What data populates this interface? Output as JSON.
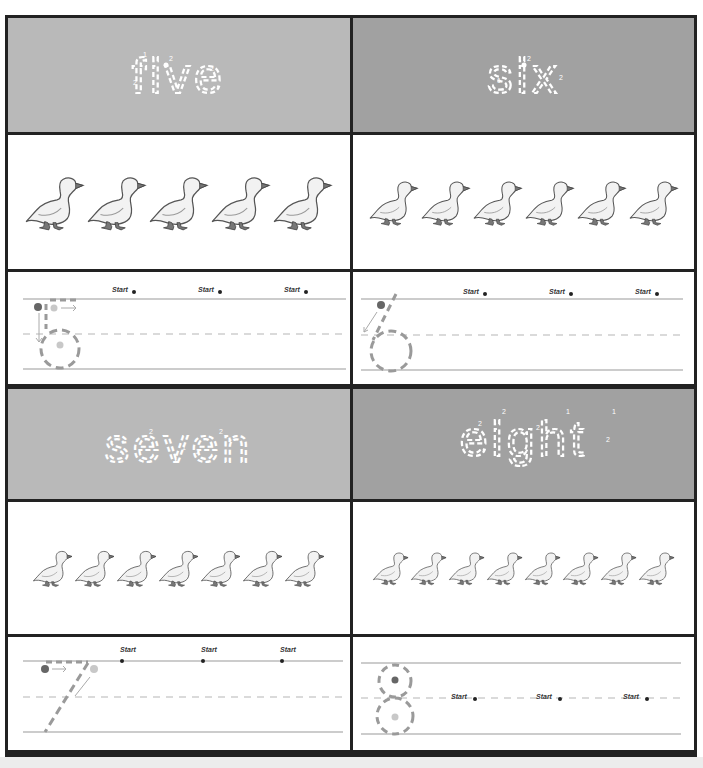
{
  "worksheet": {
    "cells": [
      {
        "id": "five",
        "word": "five",
        "number": 5,
        "duck_count": 5,
        "header_shade": "light",
        "trace_digit": "5",
        "start_labels": [
          "Start",
          "Start",
          "Start"
        ],
        "stroke_numbers": [
          "1",
          "2",
          "3"
        ]
      },
      {
        "id": "six",
        "word": "six",
        "number": 6,
        "duck_count": 6,
        "header_shade": "dark",
        "trace_digit": "6",
        "start_labels": [
          "Start",
          "Start",
          "Start"
        ],
        "stroke_numbers": [
          "1"
        ]
      },
      {
        "id": "seven",
        "word": "seven",
        "number": 7,
        "duck_count": 7,
        "header_shade": "light",
        "trace_digit": "7",
        "start_labels": [
          "Start",
          "Start",
          "Start"
        ],
        "stroke_numbers": [
          "1",
          "2"
        ]
      },
      {
        "id": "eight",
        "word": "eight",
        "number": 8,
        "duck_count": 8,
        "header_shade": "dark",
        "trace_digit": "8",
        "start_labels": [
          "Start",
          "Start",
          "Start"
        ],
        "stroke_numbers": [
          "1",
          "2"
        ]
      }
    ],
    "colors": {
      "frame": "#222222",
      "header_light": "#b9b9b9",
      "header_dark": "#a1a1a1",
      "guide_line": "#9a9a9a",
      "trace_dash": "#9a9a9a",
      "word_outline": "#ffffff"
    },
    "icons": {
      "duck": "duck-icon",
      "start_marker": "start-dot-icon",
      "direction_arrow": "arrow-icon"
    }
  }
}
